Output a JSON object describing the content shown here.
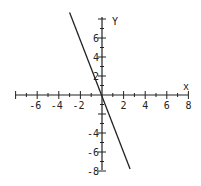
{
  "chart_data": {
    "type": "line",
    "title": "",
    "xlabel": "x",
    "ylabel": "y",
    "xlim": [
      -8,
      8
    ],
    "ylim": [
      -8,
      8
    ],
    "grid": false,
    "legend": null,
    "x_ticks": [
      -6,
      -4,
      -2,
      2,
      4,
      6,
      8
    ],
    "y_ticks": [
      -8,
      -6,
      -4,
      2,
      4,
      6
    ],
    "series": [
      {
        "name": "y = -3x",
        "equation": "y = -3x",
        "x": [
          -3,
          2.6
        ],
        "y": [
          9,
          -7.8
        ],
        "color": "#222222"
      }
    ]
  },
  "axes": {
    "x_label": "x",
    "y_label": "Y",
    "x_tick_labels": [
      "-6",
      "-4",
      "-2",
      "2",
      "4",
      "6",
      "8"
    ],
    "y_tick_labels": [
      "6",
      "4",
      "2",
      "-4",
      "-6",
      "-8"
    ]
  },
  "colors": {
    "axis": "#222222",
    "line": "#222222",
    "background": "#ffffff"
  }
}
